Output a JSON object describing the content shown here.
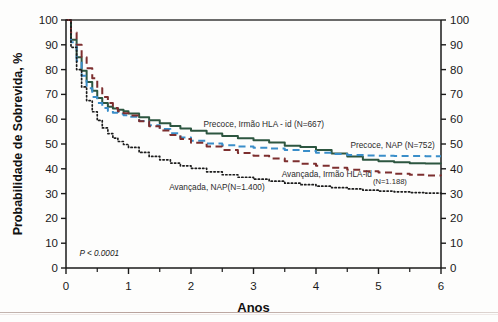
{
  "chart_data": {
    "type": "line",
    "title": "",
    "xlabel": "Anos",
    "ylabel": "Probabilidade de Sobrevida, %",
    "xlim": [
      0,
      6
    ],
    "ylim": [
      0,
      100
    ],
    "xticks": [
      0,
      1,
      2,
      3,
      4,
      5,
      6
    ],
    "xticklabels": [
      "0",
      "1",
      "2",
      "3",
      "4",
      "5",
      "6"
    ],
    "x_minor_tick_interval": 0.5,
    "yticks": [
      0,
      10,
      20,
      30,
      40,
      50,
      60,
      70,
      80,
      90,
      100
    ],
    "yticklabels": [
      "0",
      "10",
      "20",
      "30",
      "40",
      "50",
      "60",
      "70",
      "80",
      "90",
      "100"
    ],
    "y_axis_mirrored_right": true,
    "grid": false,
    "legend_position": "inline-annotations",
    "annotations": [
      {
        "text": "P < 0.0001",
        "x": 0.12,
        "y": 5,
        "style": "italic"
      }
    ],
    "series": [
      {
        "name": "Precoce, Irmão HLA - id (N=667)",
        "label": "Precoce, Irmão HLA - id (N=667)",
        "n": 667,
        "color": "#2d5640",
        "style": "solid",
        "label_x": 2.2,
        "label_y": 57,
        "x": [
          0,
          0.08,
          0.17,
          0.25,
          0.33,
          0.42,
          0.5,
          0.58,
          0.67,
          0.75,
          0.83,
          0.92,
          1.0,
          1.17,
          1.33,
          1.5,
          1.67,
          1.83,
          2.0,
          2.25,
          2.5,
          2.75,
          3.0,
          3.25,
          3.5,
          3.75,
          4.0,
          4.25,
          4.5,
          4.75,
          5.0,
          5.25,
          5.5,
          5.75,
          6.0
        ],
        "y": [
          100,
          92,
          85,
          79.5,
          75,
          71.5,
          68.5,
          66.5,
          65,
          64.3,
          63.8,
          63.2,
          62.3,
          60.8,
          59.6,
          58.4,
          57.3,
          56.2,
          55.3,
          54.2,
          53.2,
          52.3,
          51.5,
          50.6,
          49.3,
          48.8,
          47.6,
          46.2,
          45.0,
          43.6,
          43.0,
          42.6,
          42.2,
          42.1,
          42.0
        ]
      },
      {
        "name": "Precoce, NAP (N=752)",
        "label": "Precoce, NAP (N=752)",
        "n": 752,
        "color": "#3a8ec9",
        "style": "dashed",
        "label_x": 4.55,
        "label_y": 48.5,
        "x": [
          0,
          0.08,
          0.17,
          0.25,
          0.33,
          0.42,
          0.5,
          0.58,
          0.67,
          0.75,
          0.83,
          0.92,
          1.0,
          1.17,
          1.33,
          1.5,
          1.67,
          1.83,
          2.0,
          2.25,
          2.5,
          2.75,
          3.0,
          3.25,
          3.5,
          3.75,
          4.0,
          4.25,
          4.5,
          4.75,
          5.0,
          5.25,
          5.5,
          5.75,
          6.0
        ],
        "y": [
          100,
          91,
          83.5,
          77.5,
          72.5,
          69,
          66.5,
          64.5,
          63.3,
          62.6,
          62.2,
          61.6,
          61.0,
          59.3,
          57.6,
          56.0,
          54.3,
          52.6,
          51.3,
          50.2,
          49.5,
          49.0,
          48.5,
          48.2,
          47.6,
          47.2,
          46.5,
          46.0,
          45.6,
          45.4,
          45.3,
          45.2,
          45.2,
          45.1,
          45.1
        ]
      },
      {
        "name": "Avançada, Irmão HLA-id (N=1.188)",
        "label": "Avançada, Irmão HLA-id",
        "label_suffix": "(N=1.188)",
        "n": 1188,
        "color": "#7d2f2f",
        "style": "dashed",
        "label_x": 3.45,
        "label_y": 36.5,
        "x": [
          0,
          0.08,
          0.17,
          0.25,
          0.33,
          0.42,
          0.5,
          0.58,
          0.67,
          0.75,
          0.83,
          0.92,
          1.0,
          1.17,
          1.33,
          1.5,
          1.67,
          1.83,
          2.0,
          2.25,
          2.5,
          2.75,
          3.0,
          3.25,
          3.5,
          3.75,
          4.0,
          4.25,
          4.5,
          4.75,
          5.0,
          5.25,
          5.5,
          5.75,
          6.0
        ],
        "y": [
          100,
          95,
          90,
          85,
          80.5,
          76.5,
          72.5,
          69,
          66.5,
          64.5,
          63.2,
          62.4,
          61.5,
          59.2,
          57.2,
          55.4,
          53.6,
          52.0,
          50.5,
          49.0,
          47.6,
          46.4,
          45.3,
          44.2,
          43.0,
          42.0,
          41.2,
          40.4,
          39.6,
          39.0,
          38.5,
          38.0,
          37.6,
          37.3,
          37.1
        ]
      },
      {
        "name": "Avançada, NAP(N=1.400)",
        "label": "Avançada, NAP(N=1.400)",
        "n": 1400,
        "color": "#1c1c1c",
        "style": "dotted",
        "label_x": 1.65,
        "label_y": 31.5,
        "x": [
          0,
          0.08,
          0.17,
          0.25,
          0.33,
          0.42,
          0.5,
          0.58,
          0.67,
          0.75,
          0.83,
          0.92,
          1.0,
          1.17,
          1.33,
          1.5,
          1.67,
          1.83,
          2.0,
          2.25,
          2.5,
          2.75,
          3.0,
          3.25,
          3.5,
          3.75,
          4.0,
          4.25,
          4.5,
          4.75,
          5.0,
          5.25,
          5.5,
          5.75,
          6.0
        ],
        "y": [
          100,
          89,
          80,
          73,
          67.5,
          63,
          59.5,
          56.5,
          54.2,
          52.4,
          51.0,
          49.8,
          48.6,
          46.6,
          45.0,
          43.6,
          42.3,
          41.2,
          40.2,
          38.8,
          37.6,
          36.6,
          35.8,
          35.0,
          34.2,
          33.6,
          33.0,
          32.4,
          31.9,
          31.4,
          31.0,
          30.7,
          30.4,
          30.2,
          30.0
        ]
      }
    ]
  },
  "colors": {
    "axis": "#1a1a1a",
    "frame_top": "#3a3a3a",
    "background": "#fdfdfc",
    "bottom_rule": "#a98d86"
  }
}
